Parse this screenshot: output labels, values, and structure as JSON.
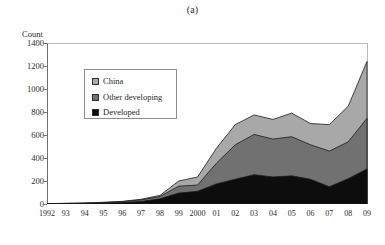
{
  "figure": {
    "panel_title": "(a)",
    "y_axis_title": "Count"
  },
  "legend": {
    "items": [
      {
        "label": "China",
        "color": "#a8a8a8"
      },
      {
        "label": "Other developing",
        "color": "#717171"
      },
      {
        "label": "Developed",
        "color": "#0d0d0d"
      }
    ]
  },
  "chart_data": {
    "type": "area",
    "stacked": true,
    "title": "(a)",
    "xlabel": "",
    "ylabel": "Count",
    "ylim": [
      0,
      1400
    ],
    "yticks": [
      0,
      200,
      400,
      600,
      800,
      1000,
      1200,
      1400
    ],
    "ytick_labels": [
      "0",
      "200",
      "400",
      "600",
      "800",
      "1000",
      "1200",
      "1400"
    ],
    "grid": false,
    "legend_position": "upper-left-inside",
    "x": [
      1992,
      1993,
      1994,
      1995,
      1996,
      1997,
      1998,
      1999,
      2000,
      2001,
      2002,
      2003,
      2004,
      2005,
      2006,
      2007,
      2008,
      2009
    ],
    "categories": [
      "1992",
      "93",
      "94",
      "95",
      "96",
      "97",
      "98",
      "99",
      "2000",
      "01",
      "02",
      "03",
      "04",
      "05",
      "06",
      "07",
      "08",
      "09"
    ],
    "series": [
      {
        "name": "Developed",
        "color": "#0d0d0d",
        "values": [
          2,
          3,
          5,
          8,
          12,
          22,
          45,
          95,
          110,
          175,
          215,
          255,
          235,
          245,
          215,
          150,
          220,
          305
        ]
      },
      {
        "name": "Other developing",
        "color": "#717171",
        "values": [
          1,
          2,
          3,
          5,
          8,
          14,
          20,
          60,
          55,
          180,
          300,
          350,
          330,
          340,
          300,
          310,
          320,
          440
        ]
      },
      {
        "name": "China",
        "color": "#a8a8a8",
        "values": [
          0,
          1,
          1,
          2,
          3,
          5,
          10,
          45,
          70,
          130,
          175,
          170,
          170,
          205,
          185,
          230,
          310,
          495
        ]
      }
    ],
    "totals": [
      3,
      6,
      9,
      15,
      23,
      41,
      75,
      200,
      235,
      485,
      690,
      775,
      735,
      790,
      700,
      690,
      850,
      1240
    ]
  }
}
